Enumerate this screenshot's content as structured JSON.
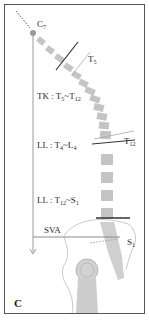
{
  "figure": {
    "panel_letter": "C",
    "colors": {
      "frame": "#555555",
      "vertebra": "#c2c2c2",
      "plumb_line": "#9a9a9a",
      "endplate_line": "#333333",
      "outline": "#b5b5b5",
      "text": "#2a2a2a"
    },
    "labels": {
      "c7": {
        "base": "C",
        "sub": "7"
      },
      "t5": {
        "base": "T",
        "sub": "5"
      },
      "t12": {
        "base": "T",
        "sub": "12"
      },
      "s1": {
        "base": "S",
        "sub": "1"
      },
      "tk": {
        "prefix": "TK : T",
        "sub1": "5",
        "mid": "~T",
        "sub2": "12"
      },
      "ll_upper": {
        "prefix": "LL : T",
        "sub1": "4",
        "mid": "~L",
        "sub2": "4"
      },
      "ll_lower": {
        "prefix": "LL : T",
        "sub1": "12",
        "mid": "~S",
        "sub2": "1"
      },
      "sva": "SVA"
    }
  }
}
